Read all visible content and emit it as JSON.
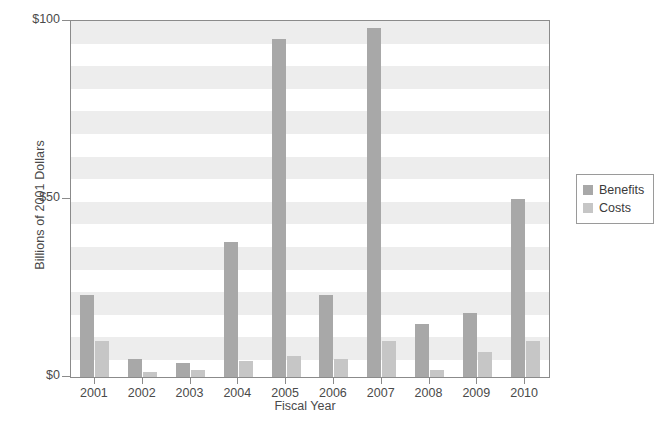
{
  "chart_data": {
    "type": "bar",
    "title": "",
    "xlabel": "Fiscal Year",
    "ylabel": "Billions of 2001 Dollars",
    "categories": [
      "2001",
      "2002",
      "2003",
      "2004",
      "2005",
      "2006",
      "2007",
      "2008",
      "2009",
      "2010"
    ],
    "series": [
      {
        "name": "Benefits",
        "color": "#a8a8a8",
        "values": [
          23,
          5,
          4,
          38,
          95,
          23,
          98,
          15,
          18,
          50
        ]
      },
      {
        "name": "Costs",
        "color": "#c6c6c6",
        "values": [
          10,
          1.5,
          2,
          4.5,
          6,
          5,
          10,
          2,
          7,
          10
        ]
      }
    ],
    "ylim": [
      0,
      100
    ],
    "ytick_values": [
      0,
      50,
      100
    ],
    "ytick_labels": [
      "$0",
      "$50",
      "$100"
    ],
    "grid": false,
    "background_bands": true,
    "legend_position": "right"
  },
  "legend": {
    "entries": [
      {
        "label": "Benefits"
      },
      {
        "label": "Costs"
      }
    ]
  },
  "axes": {
    "y_title": "Billions of 2001 Dollars",
    "x_title": "Fiscal Year"
  },
  "colors": {
    "benefits": "#a8a8a8",
    "costs": "#c6c6c6",
    "band": "#ededed",
    "axis": "#8b8b8b",
    "text": "#4a4a4a"
  }
}
